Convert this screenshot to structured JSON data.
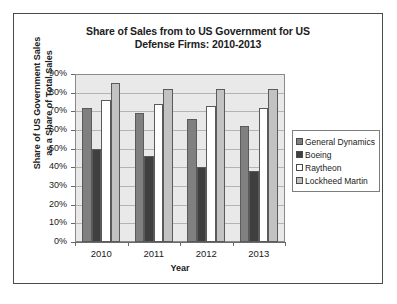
{
  "chart_data": {
    "type": "bar",
    "title": "Share of Sales from to US Government for US Defense Firms: 2010-2013",
    "title_line1": "Share of Sales from to US Government for US",
    "title_line2": "Defense Firms: 2010-2013",
    "xlabel": "Year",
    "ylabel": "Share of US Government Sales as a Share of Total Sales",
    "ylabel_line1": "Share of US Government Sales",
    "ylabel_line2": "as a Share of Total Sales",
    "categories": [
      "2010",
      "2011",
      "2012",
      "2013"
    ],
    "ylim": [
      0,
      90
    ],
    "ytick_labels": [
      "90%",
      "80%",
      "70%",
      "60%",
      "50%",
      "40%",
      "30%",
      "20%",
      "10%",
      "0%"
    ],
    "ytick_values": [
      90,
      80,
      70,
      60,
      50,
      40,
      30,
      20,
      10,
      0
    ],
    "grid": true,
    "legend_position": "right",
    "series": [
      {
        "name": "General Dynamics",
        "color": "#808080",
        "values": [
          72,
          69,
          66,
          62
        ]
      },
      {
        "name": "Boeing",
        "color": "#3f3f3f",
        "values": [
          50,
          46,
          40,
          38
        ]
      },
      {
        "name": "Raytheon",
        "color": "#ffffff",
        "values": [
          76,
          74,
          73,
          72
        ]
      },
      {
        "name": "Lockheed Martin",
        "color": "#c2c2c2",
        "values": [
          85,
          82,
          82,
          82
        ]
      }
    ]
  },
  "style": {
    "plot_background": "#e9e9e9",
    "gridline_color": "#b4b4b4",
    "axis_color": "#6a6a6a",
    "frame_border": "#4a4a4a",
    "text_color": "#1a1a1a"
  }
}
